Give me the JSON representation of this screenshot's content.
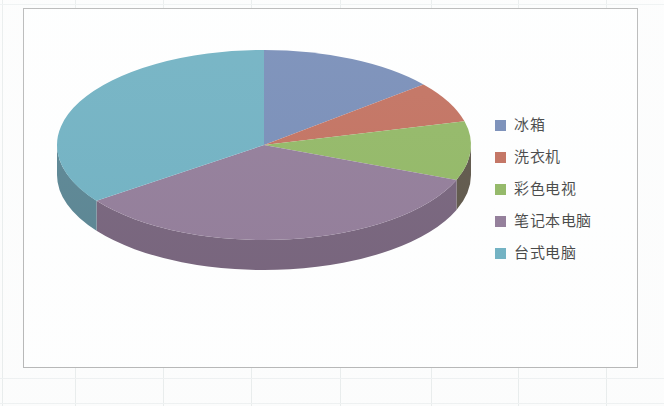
{
  "document": {
    "background_color": "#fdfdfd",
    "grid_line_color": "#e6eaea"
  },
  "chart_frame": {
    "border_color": "#a9a9a9",
    "background_color": "#ffffff"
  },
  "legend": {
    "position": "right",
    "items": [
      {
        "label": "冰箱",
        "color": "#5a74a8"
      },
      {
        "label": "洗衣机",
        "color": "#b5513c"
      },
      {
        "label": "彩色电视",
        "color": "#7aa843"
      },
      {
        "label": "笔记本电脑",
        "color": "#7a5f82"
      },
      {
        "label": "台式电脑",
        "color": "#51a0b5"
      }
    ]
  },
  "chart_data": {
    "type": "pie",
    "title": "",
    "subtitle": "",
    "xlabel": "",
    "ylabel": "",
    "three_d": true,
    "legend_position": "right",
    "grid": false,
    "labels": [
      "冰箱",
      "洗衣机",
      "彩色电视",
      "笔记本电脑",
      "台式电脑"
    ],
    "categories": [
      "冰箱",
      "洗衣机",
      "彩色电视",
      "笔记本电脑",
      "台式电脑"
    ],
    "values": [
      14,
      7,
      10,
      34,
      35
    ],
    "percentages": [
      14,
      7,
      10,
      34,
      35
    ],
    "colors": [
      "#5a74a8",
      "#b5513c",
      "#7aa843",
      "#7a5f82",
      "#51a0b5"
    ],
    "side_colors": [
      "#3c4a6b",
      "#77341f",
      "#3a3020",
      "#58405e",
      "#35697a"
    ],
    "start_angle_deg": 0,
    "direction": "clockwise"
  },
  "geometry": {
    "center_x": 240,
    "center_y": 136,
    "radius_x": 207,
    "radius_y": 95,
    "depth": 30
  }
}
